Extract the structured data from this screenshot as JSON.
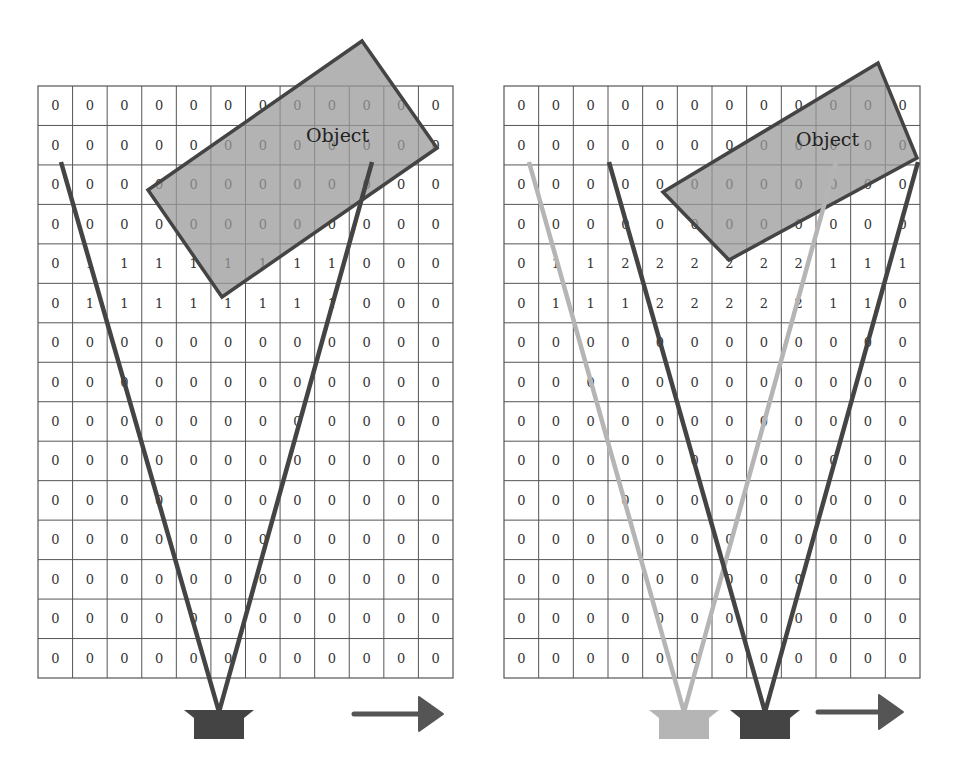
{
  "panels": [
    {
      "id": "left",
      "grid": {
        "x": 38,
        "y": 86,
        "width": 415,
        "height": 592,
        "cols": 12,
        "rows": 15,
        "values": [
          [
            "0",
            "0",
            "0",
            "0",
            "0",
            "0",
            "0",
            "0",
            "0",
            "0",
            "0",
            "0"
          ],
          [
            "0",
            "0",
            "0",
            "0",
            "0",
            "0",
            "0",
            "0",
            "0",
            "0",
            "0",
            "0"
          ],
          [
            "0",
            "0",
            "0",
            "0",
            "0",
            "0",
            "0",
            "0",
            "0",
            "0",
            "0",
            "0"
          ],
          [
            "0",
            "0",
            "0",
            "0",
            "0",
            "0",
            "0",
            "0",
            "0",
            "0",
            "0",
            "0"
          ],
          [
            "0",
            "1",
            "1",
            "1",
            "1",
            "1",
            "1",
            "1",
            "1",
            "0",
            "0",
            "0"
          ],
          [
            "0",
            "1",
            "1",
            "1",
            "1",
            "1",
            "1",
            "1",
            "1",
            "0",
            "0",
            "0"
          ],
          [
            "0",
            "0",
            "0",
            "0",
            "0",
            "0",
            "0",
            "0",
            "0",
            "0",
            "0",
            "0"
          ],
          [
            "0",
            "0",
            "0",
            "0",
            "0",
            "0",
            "0",
            "0",
            "0",
            "0",
            "0",
            "0"
          ],
          [
            "0",
            "0",
            "0",
            "0",
            "0",
            "0",
            "0",
            "0",
            "0",
            "0",
            "0",
            "0"
          ],
          [
            "0",
            "0",
            "0",
            "0",
            "0",
            "0",
            "0",
            "0",
            "0",
            "0",
            "0",
            "0"
          ],
          [
            "0",
            "0",
            "0",
            "0",
            "0",
            "0",
            "0",
            "0",
            "0",
            "0",
            "0",
            "0"
          ],
          [
            "0",
            "0",
            "0",
            "0",
            "0",
            "0",
            "0",
            "0",
            "0",
            "0",
            "0",
            "0"
          ],
          [
            "0",
            "0",
            "0",
            "0",
            "0",
            "0",
            "0",
            "0",
            "0",
            "0",
            "0",
            "0"
          ],
          [
            "0",
            "0",
            "0",
            "0",
            "0",
            "0",
            "0",
            "0",
            "0",
            "0",
            "0",
            "0"
          ],
          [
            "0",
            "0",
            "0",
            "0",
            "0",
            "0",
            "0",
            "0",
            "0",
            "0",
            "0",
            "0"
          ]
        ]
      },
      "object": {
        "label": "Object",
        "points": "148,190 362,41 437,148 222,297",
        "label_x": 306,
        "label_y": 142
      },
      "sensors": [
        {
          "name": "sensor",
          "x": 219,
          "y": 712,
          "color": "#444444",
          "ray_left": [
            61,
            162
          ],
          "ray_right": [
            372,
            162
          ]
        }
      ],
      "arrow": {
        "x1": 354,
        "x2": 443,
        "y": 714,
        "direction": "right"
      }
    },
    {
      "id": "right",
      "grid": {
        "x": 504,
        "y": 86,
        "width": 416,
        "height": 592,
        "cols": 12,
        "rows": 15,
        "values": [
          [
            "0",
            "0",
            "0",
            "0",
            "0",
            "0",
            "0",
            "0",
            "0",
            "0",
            "0",
            "0"
          ],
          [
            "0",
            "0",
            "0",
            "0",
            "0",
            "0",
            "0",
            "0",
            "0",
            "0",
            "0",
            "0"
          ],
          [
            "0",
            "0",
            "0",
            "0",
            "0",
            "0",
            "0",
            "0",
            "0",
            "0",
            "0",
            "0"
          ],
          [
            "0",
            "0",
            "0",
            "0",
            "0",
            "0",
            "0",
            "0",
            "0",
            "0",
            "0",
            "0"
          ],
          [
            "0",
            "1",
            "1",
            "2",
            "2",
            "2",
            "2",
            "2",
            "2",
            "1",
            "1",
            "1"
          ],
          [
            "0",
            "1",
            "1",
            "1",
            "2",
            "2",
            "2",
            "2",
            "2",
            "1",
            "1",
            "0"
          ],
          [
            "0",
            "0",
            "0",
            "0",
            "0",
            "0",
            "0",
            "0",
            "0",
            "0",
            "0",
            "0"
          ],
          [
            "0",
            "0",
            "0",
            "0",
            "0",
            "0",
            "0",
            "0",
            "0",
            "0",
            "0",
            "0"
          ],
          [
            "0",
            "0",
            "0",
            "0",
            "0",
            "0",
            "0",
            "0",
            "0",
            "0",
            "0",
            "0"
          ],
          [
            "0",
            "0",
            "0",
            "0",
            "0",
            "0",
            "0",
            "0",
            "0",
            "0",
            "0",
            "0"
          ],
          [
            "0",
            "0",
            "0",
            "0",
            "0",
            "0",
            "0",
            "0",
            "0",
            "0",
            "0",
            "0"
          ],
          [
            "0",
            "0",
            "0",
            "0",
            "0",
            "0",
            "0",
            "0",
            "0",
            "0",
            "0",
            "0"
          ],
          [
            "0",
            "0",
            "0",
            "0",
            "0",
            "0",
            "0",
            "0",
            "0",
            "0",
            "0",
            "0"
          ],
          [
            "0",
            "0",
            "0",
            "0",
            "0",
            "0",
            "0",
            "0",
            "0",
            "0",
            "0",
            "0"
          ],
          [
            "0",
            "0",
            "0",
            "0",
            "0",
            "0",
            "0",
            "0",
            "0",
            "0",
            "0",
            "0"
          ]
        ]
      },
      "object": {
        "label": "Object",
        "points": "663,192 878,63 917,158 729,260",
        "label_x": 796,
        "label_y": 146
      },
      "sensors": [
        {
          "name": "previous-sensor",
          "x": 684,
          "y": 712,
          "color": "#b5b5b5",
          "ray_left": [
            529,
            162
          ],
          "ray_right": [
            836,
            162
          ]
        },
        {
          "name": "current-sensor",
          "x": 765,
          "y": 712,
          "color": "#444444",
          "ray_left": [
            609,
            162
          ],
          "ray_right": [
            918,
            162
          ]
        }
      ],
      "arrow": {
        "x1": 818,
        "x2": 903,
        "y": 712,
        "direction": "right"
      }
    }
  ],
  "colors": {
    "grid_line": "#555555",
    "object_fill": "#9a9a9a",
    "object_stroke": "#444444",
    "ray_dark": "#4a4a4a",
    "ray_light": "#b0b0b0",
    "arrow": "#555555"
  }
}
